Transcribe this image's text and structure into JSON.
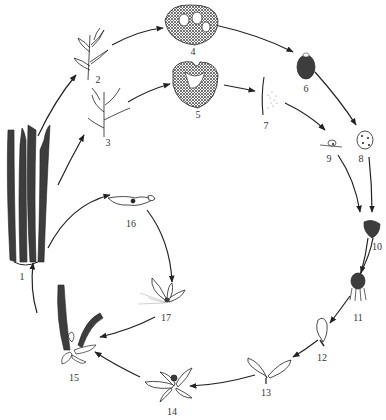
{
  "diagram": {
    "type": "life-cycle",
    "stages": [
      {
        "id": "1",
        "label": "1",
        "x": 18,
        "y": 332
      },
      {
        "id": "2",
        "label": "2",
        "x": 97,
        "y": 82
      },
      {
        "id": "3",
        "label": "3",
        "x": 109,
        "y": 145
      },
      {
        "id": "4",
        "label": "4",
        "x": 193,
        "y": 52
      },
      {
        "id": "5",
        "label": "5",
        "x": 199,
        "y": 118
      },
      {
        "id": "6",
        "label": "6",
        "x": 306,
        "y": 89
      },
      {
        "id": "7",
        "label": "7",
        "x": 266,
        "y": 127
      },
      {
        "id": "8",
        "label": "8",
        "x": 361,
        "y": 159
      },
      {
        "id": "9",
        "label": "9",
        "x": 329,
        "y": 159
      },
      {
        "id": "10",
        "label": "10",
        "x": 377,
        "y": 247
      },
      {
        "id": "11",
        "label": "11",
        "x": 358,
        "y": 313
      },
      {
        "id": "12",
        "label": "12",
        "x": 322,
        "y": 355
      },
      {
        "id": "13",
        "label": "13",
        "x": 266,
        "y": 390
      },
      {
        "id": "14",
        "label": "14",
        "x": 173,
        "y": 409
      },
      {
        "id": "15",
        "label": "15",
        "x": 74,
        "y": 375
      },
      {
        "id": "16",
        "label": "16",
        "x": 131,
        "y": 223
      },
      {
        "id": "17",
        "label": "17",
        "x": 166,
        "y": 316
      }
    ]
  }
}
